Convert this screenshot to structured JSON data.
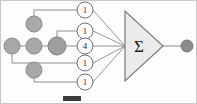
{
  "figure": {
    "background_color": "#fdfdfd",
    "border_color": "#c8c8c8",
    "wire_color": "#8d8d8d",
    "node_color": "#a9a9a9",
    "center_node_color": "#9e9e9e",
    "output_node_color": "#8c8c8c",
    "weight_circle_fill": "#fefefe",
    "weight_circle_stroke": "#6f6f6f",
    "triangle_fill": "#ebebeb",
    "triangle_stroke": "#7a7a7a",
    "caption_bar_color": "#3a3a3a"
  },
  "diagram": {
    "type": "weighted-sum-network",
    "summation_symbol": "Σ",
    "input_nodes": [
      {
        "id": "node-top",
        "label": "",
        "cx": 33,
        "cy": 23
      },
      {
        "id": "node-left",
        "label": "",
        "cx": 11,
        "cy": 45
      },
      {
        "id": "node-center-left",
        "label": "",
        "cx": 33,
        "cy": 45
      },
      {
        "id": "node-center",
        "label": "",
        "cx": 56,
        "cy": 45
      },
      {
        "id": "node-bottom",
        "label": "",
        "cx": 33,
        "cy": 69
      }
    ],
    "weights": [
      {
        "id": "weight-1",
        "value": "1",
        "cx": 84,
        "cy": 9,
        "from": "node-top"
      },
      {
        "id": "weight-2",
        "value": "1",
        "cx": 84,
        "cy": 30,
        "from": "node-center"
      },
      {
        "id": "weight-3",
        "value": "4",
        "cx": 84,
        "cy": 45,
        "from": "node-center-left"
      },
      {
        "id": "weight-4",
        "value": "1",
        "cx": 84,
        "cy": 62,
        "from": "node-left"
      },
      {
        "id": "weight-5",
        "value": "1",
        "cx": 84,
        "cy": 81,
        "from": "node-bottom"
      }
    ],
    "summation_unit": {
      "id": "sum-triangle",
      "symbol": "Σ",
      "apex_x": 162,
      "cy": 45
    },
    "output_node": {
      "id": "output-node",
      "label": "",
      "cx": 186,
      "cy": 45
    },
    "caption_bar": {
      "x": 62,
      "y": 95,
      "width": 18,
      "height": 5
    }
  }
}
